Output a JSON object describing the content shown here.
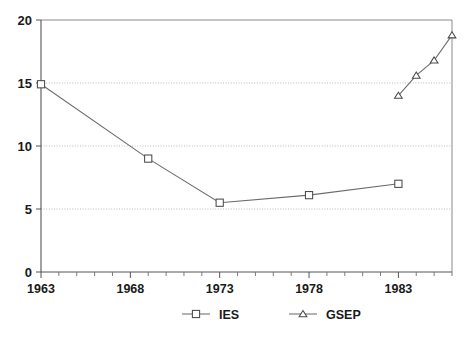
{
  "chart_data": {
    "type": "line",
    "title": "",
    "subtitle": "",
    "xlabel": "",
    "ylabel": "",
    "xlim": [
      1963,
      1986
    ],
    "ylim": [
      0,
      20
    ],
    "grid": "horizontal-dotted",
    "legend_position": "bottom-center",
    "y_ticks": [
      0,
      5,
      10,
      15,
      20
    ],
    "y_tick_labels": [
      "0",
      "5",
      "10",
      "15",
      "20"
    ],
    "x_ticks": [
      1963,
      1968,
      1973,
      1978,
      1983
    ],
    "x_tick_labels": [
      "1963",
      "1968",
      "1973",
      "1978",
      "1983"
    ],
    "x_minor_tick_step": 1,
    "series": [
      {
        "name": "IES",
        "marker": "square",
        "x": [
          1963,
          1969,
          1973,
          1978,
          1983
        ],
        "values": [
          14.9,
          9.0,
          5.5,
          6.1,
          7.0
        ]
      },
      {
        "name": "GSEP",
        "marker": "triangle",
        "x": [
          1983,
          1984,
          1985,
          1986
        ],
        "values": [
          14.0,
          15.6,
          16.8,
          18.8
        ]
      }
    ],
    "colors": {
      "line": "#6b6b6b",
      "marker_stroke": "#4a4a4a",
      "marker_fill": "#ffffff",
      "axis": "#555555",
      "grid": "#b9b9b9",
      "text": "#1a1a1a",
      "background": "#ffffff"
    }
  },
  "legend": {
    "entries": [
      {
        "label": "IES",
        "marker": "square"
      },
      {
        "label": "GSEP",
        "marker": "triangle"
      }
    ]
  }
}
